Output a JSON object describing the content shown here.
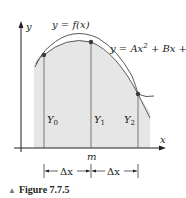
{
  "figure": {
    "caption": "Figure 7.7.5",
    "caption_marker": "▲",
    "labels": {
      "y_axis": "y",
      "x_axis": "x",
      "curve_f": "y = f(x)",
      "curve_parabola_main": "y = Ax",
      "curve_parabola_exp": "2",
      "curve_parabola_rest": " + Bx + C",
      "ordinate_0": "Y",
      "ordinate_0_sub": "0",
      "ordinate_1": "Y",
      "ordinate_1_sub": "1",
      "ordinate_2": "Y",
      "ordinate_2_sub": "2",
      "midpoint": "m",
      "delta_left": "Δx",
      "delta_right": "Δx"
    },
    "colors": {
      "ink": "#231f20",
      "shade": "#e6e6e6",
      "curve": "#5a5a5a",
      "point": "#3a3a3a"
    }
  }
}
